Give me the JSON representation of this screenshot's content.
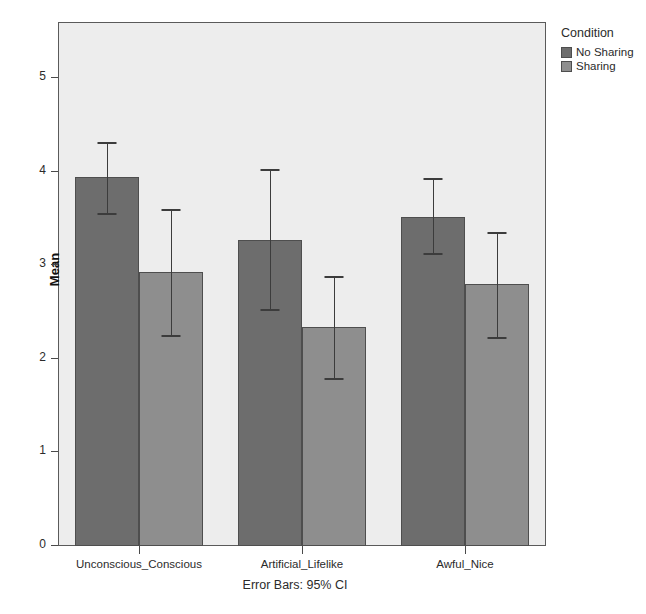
{
  "chart_data": {
    "type": "bar",
    "title": "",
    "subtitle": "",
    "xlabel": "",
    "ylabel": "Mean",
    "ylim": [
      0,
      5.45
    ],
    "yticks": [
      0,
      1,
      2,
      3,
      4,
      5
    ],
    "ytick_labels": [
      "0",
      "1",
      "2",
      "3",
      "4",
      "5"
    ],
    "grid": false,
    "legend_position": "right",
    "legend_title": "Condition",
    "categories": [
      "Unconscious_Conscious",
      "Artificial_Lifelike",
      "Awful_Nice"
    ],
    "series": [
      {
        "name": "No Sharing",
        "color": "#6d6d6d",
        "values": [
          3.94,
          3.27,
          3.52
        ],
        "ci_low": [
          3.56,
          2.53,
          3.13
        ],
        "ci_high": [
          4.32,
          4.03,
          3.93
        ]
      },
      {
        "name": "Sharing",
        "color": "#8e8e8e",
        "values": [
          2.93,
          2.34,
          2.8
        ],
        "ci_low": [
          2.25,
          1.79,
          2.23
        ],
        "ci_high": [
          3.6,
          2.88,
          3.36
        ]
      }
    ],
    "error_bar_note": "Error Bars: 95% CI",
    "colors": {
      "plot_background": "#ededed",
      "page_background": "#ffffff",
      "axis": "#5a5a5a",
      "error_bar": "#3c3c3c"
    }
  }
}
